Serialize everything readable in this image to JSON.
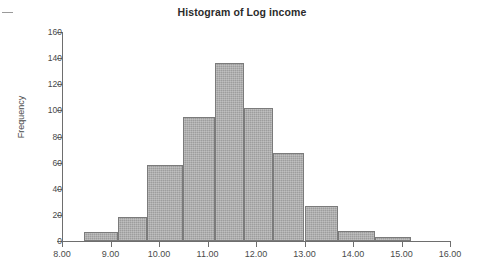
{
  "chart_data": {
    "type": "bar",
    "title": "Histogram of Log income",
    "xlabel": "",
    "ylabel": "Frequency",
    "xlim": [
      8.0,
      16.0
    ],
    "ylim": [
      0,
      160
    ],
    "grid": false,
    "legend": null,
    "bin_width": 0.5,
    "bin_edges": [
      8.5,
      9.0,
      9.5,
      10.0,
      10.5,
      11.0,
      11.5,
      12.0,
      12.5,
      13.0,
      13.5,
      14.0,
      14.5,
      15.0,
      15.25
    ],
    "categories": [
      "8.50-9.00",
      "9.00-9.50",
      "9.50-10.00",
      "10.00-10.50",
      "10.50-11.00",
      "11.00-11.50",
      "11.50-12.00",
      "12.00-12.50",
      "12.50-13.00",
      "13.00-13.50",
      "13.50-14.00",
      "14.00-14.50",
      "14.50-15.00",
      "15.00-15.25"
    ],
    "values": [
      7,
      7,
      18,
      58,
      58,
      95,
      136,
      102,
      102,
      67,
      27,
      8,
      3,
      3
    ],
    "bars": [
      {
        "start": 8.45,
        "end": 9.15,
        "value": 7
      },
      {
        "start": 9.15,
        "end": 9.75,
        "value": 18
      },
      {
        "start": 9.75,
        "end": 10.5,
        "value": 58
      },
      {
        "start": 10.5,
        "end": 11.15,
        "value": 95
      },
      {
        "start": 11.15,
        "end": 11.75,
        "value": 136
      },
      {
        "start": 11.75,
        "end": 12.35,
        "value": 102
      },
      {
        "start": 12.35,
        "end": 13.0,
        "value": 67
      },
      {
        "start": 13.0,
        "end": 13.7,
        "value": 27
      },
      {
        "start": 13.7,
        "end": 14.45,
        "value": 8
      },
      {
        "start": 14.45,
        "end": 15.2,
        "value": 3
      }
    ],
    "xticks": [
      "8.00",
      "9.00",
      "10.00",
      "11.00",
      "12.00",
      "13.00",
      "14.00",
      "15.00",
      "16.00"
    ],
    "xtick_values": [
      8,
      9,
      10,
      11,
      12,
      13,
      14,
      15,
      16
    ],
    "yticks": [
      "0",
      "20",
      "40",
      "60",
      "80",
      "100",
      "120",
      "140",
      "160"
    ],
    "ytick_values": [
      0,
      20,
      40,
      60,
      80,
      100,
      120,
      140,
      160
    ],
    "bar_color": "#9d9d9d",
    "bar_edge_color": "#7b7b7b",
    "axis_color": "#6e6e6e",
    "background": "#ffffff"
  }
}
